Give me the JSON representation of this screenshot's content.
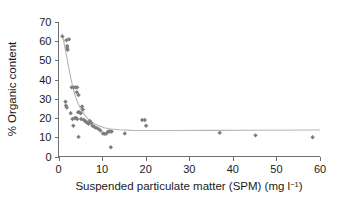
{
  "chart_data": {
    "type": "scatter",
    "title": "",
    "xlabel": "Suspended particulate matter (SPM) (mg l⁻¹)",
    "ylabel": "% Organic content",
    "xlim": [
      0,
      60
    ],
    "ylim": [
      0,
      70
    ],
    "xticks": [
      0,
      10,
      20,
      30,
      40,
      50,
      60
    ],
    "yticks": [
      0,
      10,
      20,
      30,
      40,
      50,
      60,
      70
    ],
    "xtick_labels": [
      "0",
      "10",
      "20",
      "30",
      "40",
      "50",
      "60"
    ],
    "ytick_labels": [
      "0",
      "10",
      "20",
      "30",
      "40",
      "50",
      "60",
      "70"
    ],
    "grid": false,
    "legend": null,
    "marker": "diamond",
    "marker_color": "#7d7d7d",
    "curve_color": "#b5b5b5",
    "axis_color": "#6f6f6f",
    "series": [
      {
        "name": "Samples",
        "marker": "diamond",
        "points": [
          [
            0.9,
            62.5
          ],
          [
            1.8,
            60.5
          ],
          [
            2.0,
            57.5
          ],
          [
            2.0,
            56.5
          ],
          [
            2.1,
            55.5
          ],
          [
            2.4,
            61.0
          ],
          [
            1.6,
            28.5
          ],
          [
            1.7,
            26.5
          ],
          [
            1.9,
            25.5
          ],
          [
            3.0,
            36.0
          ],
          [
            3.5,
            36.0
          ],
          [
            3.9,
            36.0
          ],
          [
            4.3,
            36.0
          ],
          [
            4.2,
            33.5
          ],
          [
            4.6,
            32.0
          ],
          [
            2.8,
            22.5
          ],
          [
            3.2,
            19.5
          ],
          [
            3.4,
            16.0
          ],
          [
            3.8,
            20.0
          ],
          [
            4.0,
            20.0
          ],
          [
            4.3,
            19.5
          ],
          [
            4.5,
            23.0
          ],
          [
            4.8,
            23.0
          ],
          [
            5.1,
            22.5
          ],
          [
            5.2,
            19.5
          ],
          [
            5.4,
            26.0
          ],
          [
            5.6,
            24.5
          ],
          [
            4.6,
            10.2
          ],
          [
            5.8,
            19.0
          ],
          [
            6.1,
            18.5
          ],
          [
            6.4,
            18.0
          ],
          [
            6.6,
            17.5
          ],
          [
            6.9,
            17.0
          ],
          [
            7.2,
            18.5
          ],
          [
            7.5,
            17.5
          ],
          [
            7.8,
            16.0
          ],
          [
            8.2,
            15.5
          ],
          [
            8.6,
            15.0
          ],
          [
            9.1,
            14.5
          ],
          [
            9.6,
            13.5
          ],
          [
            10.2,
            12.0
          ],
          [
            10.6,
            11.8
          ],
          [
            11.0,
            12.0
          ],
          [
            11.4,
            13.0
          ],
          [
            11.8,
            13.0
          ],
          [
            12.2,
            13.0
          ],
          [
            12.0,
            4.8
          ],
          [
            15.2,
            12.0
          ],
          [
            19.2,
            19.0
          ],
          [
            19.8,
            19.0
          ],
          [
            20.1,
            16.0
          ],
          [
            37.0,
            12.3
          ],
          [
            45.2,
            11.0
          ],
          [
            58.3,
            10.0
          ]
        ]
      }
    ],
    "fit_curve": {
      "name": "fitted trend",
      "points": [
        [
          0.8,
          64.0
        ],
        [
          1.2,
          60.0
        ],
        [
          1.7,
          54.0
        ],
        [
          2.2,
          48.0
        ],
        [
          2.8,
          41.0
        ],
        [
          3.4,
          35.0
        ],
        [
          4.0,
          30.5
        ],
        [
          4.6,
          27.0
        ],
        [
          5.3,
          24.0
        ],
        [
          6.0,
          21.5
        ],
        [
          6.8,
          19.5
        ],
        [
          7.6,
          18.0
        ],
        [
          8.5,
          16.8
        ],
        [
          9.5,
          15.8
        ],
        [
          10.5,
          15.0
        ],
        [
          12.0,
          14.3
        ],
        [
          14.0,
          13.9
        ],
        [
          17.0,
          13.6
        ],
        [
          21.0,
          13.5
        ],
        [
          27.0,
          13.5
        ],
        [
          35.0,
          13.6
        ],
        [
          45.0,
          13.7
        ],
        [
          60.0,
          13.8
        ]
      ]
    }
  }
}
